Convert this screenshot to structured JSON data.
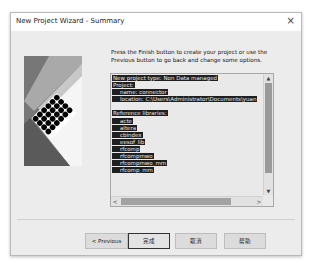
{
  "window": {
    "title": "New Project Wizard - Summary",
    "close_icon": "×"
  },
  "instructions": "Press the Finish button to create your project or use the Previous button to go back and change some options.",
  "summary": {
    "lines": [
      {
        "text": "New project type:  Non Data managed",
        "indent": 0
      },
      {
        "text": "Project:",
        "indent": 0
      },
      {
        "text": "name: connector",
        "indent": 1
      },
      {
        "text": "location: C:\\Users\\Administrator\\Documents\\yuan",
        "indent": 1
      },
      {
        "text": "",
        "indent": 0
      },
      {
        "text": "Reference libraries:",
        "indent": 0
      },
      {
        "text": "acte",
        "indent": 1
      },
      {
        "text": "altera",
        "indent": 1
      },
      {
        "text": "cbindex",
        "indent": 1
      },
      {
        "text": "eesof_lib",
        "indent": 1
      },
      {
        "text": "rfcomp",
        "indent": 1
      },
      {
        "text": "rfcompmwo",
        "indent": 1
      },
      {
        "text": "rfcompmwo_mm",
        "indent": 1
      },
      {
        "text": "rfcomp_mm",
        "indent": 1
      }
    ],
    "scroll_up_icon": "▲",
    "scroll_down_icon": "▼",
    "scroll_left_icon": "<",
    "scroll_right_icon": ">"
  },
  "buttons": {
    "previous": "< Previous",
    "finish": "完成",
    "cancel": "取消",
    "help": "帮助"
  }
}
